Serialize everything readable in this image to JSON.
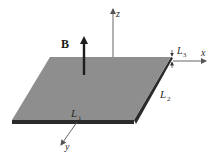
{
  "diagram": {
    "type": "physics-schematic",
    "colors": {
      "plate_top": "#8e8e8e",
      "plate_edge": "#2b2b2b",
      "axis_line": "#555555",
      "b_arrow": "#1e1e1e",
      "background": "#ffffff"
    },
    "labels": {
      "field": "B",
      "axis_x": "x",
      "axis_y": "y",
      "axis_z": "z",
      "length_1": "L",
      "length_1_sub": "1",
      "length_2": "L",
      "length_2_sub": "2",
      "length_3": "L",
      "length_3_sub": "3"
    }
  }
}
